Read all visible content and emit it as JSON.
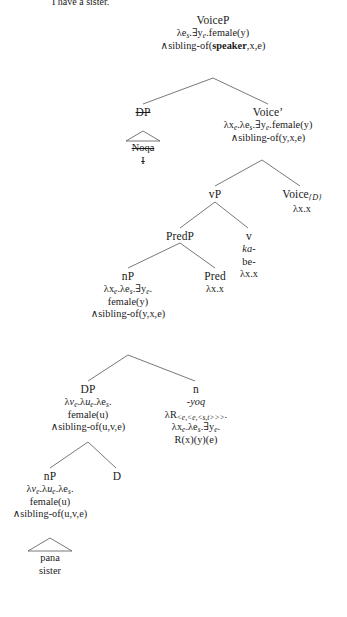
{
  "caption": {
    "text": "I have a sister."
  },
  "tree": {
    "title": "Quechua VoiceP syntactic derivation with semantic denotations",
    "nodes": [
      {
        "id": "voiceP",
        "label": "VoiceP",
        "denotation_lines": [
          "λeₛ.∃yₑ.female(y)",
          "∧sibling-of(speaker,x,e)"
        ]
      },
      {
        "id": "dp-subject",
        "label": "DP",
        "struck": true,
        "terminal_lines": [
          "Noqa",
          "I"
        ]
      },
      {
        "id": "voice-bar",
        "label": "Voice'",
        "denotation_lines": [
          "λxₑ.λeₛ.∃yₑ.female(y)",
          "∧sibling-of(y,x,e)"
        ]
      },
      {
        "id": "vP",
        "label": "vP",
        "denotation_lines": []
      },
      {
        "id": "voice-d",
        "label": "Voice{D}",
        "denotation_lines": [
          "λx.x"
        ]
      },
      {
        "id": "predP",
        "label": "PredP",
        "denotation_lines": []
      },
      {
        "id": "v-head",
        "label": "v",
        "morpheme": "ka-",
        "gloss": "be-",
        "denotation_lines": [
          "λx.x"
        ]
      },
      {
        "id": "nP-upper",
        "label": "nP",
        "denotation_lines": [
          "λxₑ.λeₛ.∃yₑ.",
          "female(y)",
          "∧sibling-of(y,x,e)"
        ]
      },
      {
        "id": "pred-head",
        "label": "Pred",
        "denotation_lines": [
          "λx.x"
        ]
      },
      {
        "id": "dp-lower",
        "label": "DP",
        "denotation_lines": [
          "λvₑ.λuₑ.λeₛ.",
          "female(u)",
          "∧sibling-of(u,v,e)"
        ]
      },
      {
        "id": "n-head",
        "label": "n",
        "morpheme": "-yoq",
        "denotation_lines": [
          "λR⟨e,⟨e,⟨s,t⟩⟩⟩.",
          "λxₑ.λeₛ.∃yₑ.",
          "R(x)(y)(e)"
        ]
      },
      {
        "id": "nP-lower",
        "label": "nP",
        "denotation_lines": [
          "λvₑ.λuₑ.λeₛ.",
          "female(u)",
          "∧sibling-of(u,v,e)"
        ]
      },
      {
        "id": "d-head",
        "label": "D",
        "denotation_lines": []
      },
      {
        "id": "terminal-pana",
        "terminal_lines": [
          "pana",
          "sister"
        ]
      }
    ]
  },
  "labels": {
    "voiceP": "VoiceP",
    "voiceP_den1": "λe",
    "voiceP_den1_sub": "s",
    "voiceP_den1_rest": ".∃y",
    "voiceP_den1_sub2": "e",
    "voiceP_den1_tail": ".female(y)",
    "voiceP_den2_pre": "∧sibling-of(",
    "voiceP_den2_bold": "speaker",
    "voiceP_den2_post": ",x,e)",
    "dp": "DP",
    "noqa": "Noqa",
    "i": "I",
    "voice_bar": "Voice’",
    "voice_bar_den2": "∧sibling-of(y,x,e)",
    "vP": "vP",
    "voice_sub": "Voice",
    "voice_sub_index": "{D}",
    "lambda_xx": "λx.x",
    "predP": "PredP",
    "v": "v",
    "ka": "ka-",
    "be": "be-",
    "nP": "nP",
    "female_y": "female(y)",
    "sibling_yxe": "∧sibling-of(y,x,e)",
    "pred": "Pred",
    "female_u": "female(u)",
    "sibling_uve": "∧sibling-of(u,v,e)",
    "n": "n",
    "yoq": "-yoq",
    "rxye": "R(x)(y)(e)",
    "d": "D",
    "pana": "pana",
    "sister": "sister"
  },
  "colors": {
    "line": "#555555",
    "text": "#1a1a1a",
    "background": "#ffffff"
  }
}
